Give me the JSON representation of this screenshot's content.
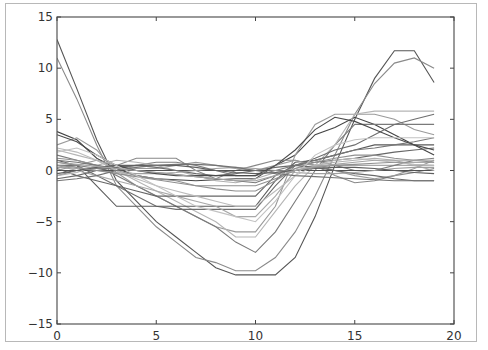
{
  "chart_data": {
    "type": "line",
    "title": "",
    "xlabel": "",
    "ylabel": "",
    "xlim": [
      0,
      20
    ],
    "ylim": [
      -15,
      15
    ],
    "grid": false,
    "legend": null,
    "xticks": [
      "0",
      "5",
      "10",
      "15",
      "20"
    ],
    "yticks": [
      "15",
      "10",
      "5",
      "0",
      "−5",
      "−10",
      "−15"
    ],
    "x": [
      0,
      1,
      2,
      3,
      4,
      5,
      6,
      7,
      8,
      9,
      10,
      11,
      12,
      13,
      14,
      15,
      16,
      17,
      18,
      19
    ],
    "series": [
      {
        "name": "s1",
        "color": "#555555",
        "values": [
          12.8,
          8.0,
          3.0,
          -1.0,
          -3.0,
          -5.0,
          -6.5,
          -8.0,
          -9.5,
          -10.2,
          -10.2,
          -10.2,
          -8.5,
          -4.5,
          0.5,
          5.0,
          9.0,
          11.7,
          11.7,
          8.6
        ]
      },
      {
        "name": "s2",
        "color": "#8a8a8a",
        "values": [
          11.0,
          7.0,
          2.5,
          -1.5,
          -3.5,
          -5.5,
          -7.0,
          -8.5,
          -9.0,
          -9.8,
          -9.8,
          -8.5,
          -6.0,
          -2.5,
          1.5,
          5.5,
          8.5,
          10.5,
          11.0,
          10.0
        ]
      },
      {
        "name": "s3",
        "color": "#444444",
        "values": [
          3.8,
          3.0,
          1.2,
          0.2,
          -0.5,
          -0.8,
          -0.9,
          -1.0,
          -0.9,
          -0.8,
          -0.8,
          0.5,
          1.5,
          3.5,
          4.2,
          5.2,
          4.5,
          3.5,
          2.5,
          1.5
        ]
      },
      {
        "name": "s4",
        "color": "#9a9a9a",
        "values": [
          2.5,
          3.2,
          2.0,
          -0.2,
          -1.5,
          -2.5,
          -3.5,
          -4.5,
          -5.5,
          -6.0,
          -6.0,
          -3.5,
          1.5,
          4.5,
          5.5,
          5.5,
          5.5,
          5.0,
          4.0,
          3.5
        ]
      },
      {
        "name": "s5",
        "color": "#7a7a7a",
        "values": [
          1.5,
          1.0,
          0.5,
          -0.5,
          -1.5,
          -2.5,
          -3.5,
          -4.5,
          -5.5,
          -7.0,
          -8.0,
          -6.0,
          -3.0,
          0.0,
          2.5,
          4.5,
          4.5,
          4.5,
          4.5,
          4.5
        ]
      },
      {
        "name": "s6",
        "color": "#b5b5b5",
        "values": [
          2.0,
          1.5,
          1.0,
          0.0,
          -1.0,
          -2.0,
          -3.0,
          -4.0,
          -5.0,
          -6.5,
          -6.5,
          -4.0,
          -1.5,
          0.5,
          2.5,
          5.5,
          5.8,
          5.8,
          5.8,
          5.8
        ]
      },
      {
        "name": "s7",
        "color": "#6e6e6e",
        "values": [
          0.5,
          0.5,
          -0.5,
          -1.5,
          -2.5,
          -3.5,
          -3.8,
          -3.8,
          -3.8,
          -3.8,
          -3.8,
          -1.5,
          0.5,
          1.2,
          2.0,
          2.5,
          3.5,
          4.5,
          5.0,
          5.5
        ]
      },
      {
        "name": "s8",
        "color": "#5a5a5a",
        "values": [
          1.0,
          0.5,
          -1.5,
          -3.5,
          -3.5,
          -3.5,
          -3.5,
          -3.5,
          -3.5,
          -3.5,
          -3.5,
          -1.0,
          0.8,
          1.0,
          1.5,
          2.0,
          2.5,
          2.5,
          2.5,
          2.5
        ]
      },
      {
        "name": "s9",
        "color": "#a8a8a8",
        "values": [
          0.5,
          0.0,
          -0.5,
          -1.0,
          -1.5,
          -2.0,
          -2.5,
          -3.0,
          -3.5,
          -4.5,
          -4.5,
          -2.5,
          0.0,
          0.5,
          0.5,
          0.5,
          0.5,
          0.5,
          0.5,
          0.5
        ]
      },
      {
        "name": "s10",
        "color": "#888888",
        "values": [
          -0.5,
          0.0,
          0.2,
          0.5,
          1.2,
          1.2,
          1.2,
          0.0,
          -0.8,
          0.0,
          0.5,
          1.0,
          1.0,
          0.5,
          -0.5,
          -1.2,
          -1.0,
          -0.5,
          -0.2,
          0.2
        ]
      },
      {
        "name": "s11",
        "color": "#666666",
        "values": [
          0.2,
          -0.5,
          -1.0,
          -1.5,
          -2.0,
          -2.5,
          -2.5,
          -2.5,
          -2.5,
          -2.5,
          -2.5,
          -0.5,
          0.5,
          0.8,
          1.0,
          1.2,
          1.5,
          1.8,
          2.0,
          2.2
        ]
      },
      {
        "name": "s12",
        "color": "#999999",
        "values": [
          0.0,
          0.5,
          1.0,
          0.5,
          0.2,
          0.2,
          0.5,
          0.8,
          0.5,
          0.2,
          0.0,
          0.5,
          1.0,
          0.5,
          0.0,
          -0.5,
          -0.8,
          -0.5,
          0.2,
          1.0
        ]
      },
      {
        "name": "s13",
        "color": "#7f7f7f",
        "values": [
          0.8,
          0.5,
          0.2,
          0.2,
          0.5,
          0.8,
          0.8,
          0.5,
          0.0,
          -0.5,
          -0.5,
          0.0,
          0.5,
          1.0,
          0.5,
          0.0,
          0.0,
          0.5,
          1.0,
          1.2
        ]
      },
      {
        "name": "s14",
        "color": "#505050",
        "values": [
          0.0,
          0.0,
          0.0,
          0.0,
          0.0,
          0.0,
          0.0,
          0.0,
          0.0,
          0.0,
          0.0,
          0.0,
          0.0,
          0.0,
          0.0,
          0.0,
          0.0,
          0.0,
          0.0,
          0.0
        ]
      },
      {
        "name": "s15",
        "color": "#b0b0b0",
        "values": [
          -0.5,
          -0.2,
          0.5,
          1.0,
          0.8,
          0.5,
          0.0,
          -0.5,
          -1.0,
          -1.2,
          -0.8,
          -0.2,
          0.2,
          0.5,
          0.8,
          1.0,
          1.2,
          1.0,
          0.5,
          0.0
        ]
      },
      {
        "name": "s16",
        "color": "#909090",
        "values": [
          1.2,
          1.0,
          0.5,
          0.0,
          -0.5,
          -0.8,
          -1.0,
          -1.5,
          -1.8,
          -2.0,
          -2.0,
          -1.0,
          0.2,
          0.8,
          1.2,
          1.5,
          1.5,
          1.2,
          1.0,
          0.8
        ]
      },
      {
        "name": "s17",
        "color": "#6a6a6a",
        "values": [
          -0.8,
          -0.5,
          0.0,
          0.3,
          0.5,
          0.3,
          0.0,
          -0.3,
          -0.5,
          -0.3,
          0.0,
          0.3,
          0.5,
          0.3,
          0.0,
          -0.3,
          -0.5,
          -0.8,
          -1.0,
          -1.0
        ]
      },
      {
        "name": "s18",
        "color": "#a0a0a0",
        "values": [
          0.3,
          0.2,
          0.0,
          -0.2,
          -0.3,
          -0.3,
          -0.2,
          0.0,
          0.2,
          0.3,
          0.2,
          0.0,
          -0.2,
          -0.3,
          -0.3,
          -0.2,
          0.0,
          0.2,
          0.3,
          0.3
        ]
      },
      {
        "name": "s19",
        "color": "#777777",
        "values": [
          1.0,
          0.8,
          0.5,
          0.2,
          0.0,
          -0.2,
          -0.4,
          -0.6,
          -0.8,
          -1.0,
          -1.2,
          -0.5,
          0.5,
          1.0,
          1.5,
          2.0,
          2.2,
          2.5,
          2.8,
          3.2
        ]
      },
      {
        "name": "s20",
        "color": "#bbbbbb",
        "values": [
          2.2,
          1.8,
          1.0,
          0.0,
          -0.8,
          -1.5,
          -2.0,
          -2.5,
          -3.0,
          -3.5,
          -3.5,
          -2.0,
          -0.5,
          0.5,
          1.0,
          1.2,
          1.0,
          0.8,
          0.6,
          0.5
        ]
      },
      {
        "name": "s21",
        "color": "#5f5f5f",
        "values": [
          -0.3,
          0.0,
          0.3,
          0.5,
          0.5,
          0.5,
          0.5,
          0.3,
          0.0,
          -0.2,
          -0.3,
          -0.2,
          0.0,
          0.2,
          0.3,
          0.3,
          0.2,
          0.0,
          -0.2,
          -0.3
        ]
      },
      {
        "name": "s22",
        "color": "#8f8f8f",
        "values": [
          0.5,
          0.3,
          0.0,
          -0.3,
          -0.6,
          -0.9,
          -1.2,
          -1.5,
          -1.5,
          -1.5,
          -1.5,
          -0.8,
          0.0,
          0.3,
          0.5,
          0.6,
          0.7,
          0.8,
          0.8,
          0.8
        ]
      },
      {
        "name": "s23",
        "color": "#4a4a4a",
        "values": [
          3.5,
          2.8,
          1.5,
          0.5,
          0.0,
          -0.3,
          -0.5,
          -0.5,
          -0.5,
          -0.5,
          -0.5,
          0.5,
          2.0,
          4.0,
          5.2,
          4.8,
          4.0,
          3.2,
          2.5,
          2.0
        ]
      },
      {
        "name": "s24",
        "color": "#c2c2c2",
        "values": [
          1.8,
          2.2,
          1.5,
          0.5,
          -0.5,
          -1.5,
          -2.5,
          -3.5,
          -4.0,
          -4.5,
          -5.0,
          -3.0,
          -0.5,
          1.5,
          2.5,
          3.0,
          3.2,
          3.2,
          3.2,
          3.2
        ]
      },
      {
        "name": "s25",
        "color": "#737373",
        "values": [
          -1.0,
          -0.8,
          -0.5,
          0.0,
          0.3,
          0.5,
          0.6,
          0.6,
          0.5,
          0.3,
          0.0,
          -0.3,
          -0.5,
          -0.6,
          -0.7,
          -0.8,
          -0.9,
          -1.0,
          -1.0,
          -1.0
        ]
      },
      {
        "name": "s26",
        "color": "#a4a4a4",
        "values": [
          0.8,
          0.6,
          0.4,
          0.2,
          0.0,
          -0.2,
          -0.4,
          -0.6,
          -0.8,
          -1.0,
          -1.0,
          -0.5,
          0.0,
          0.4,
          0.6,
          0.8,
          1.0,
          1.0,
          1.0,
          1.0
        ]
      }
    ]
  },
  "axes": {
    "plot_left": 57,
    "plot_top": 17,
    "plot_right": 454,
    "plot_bottom": 324,
    "axis_color": "#555555",
    "tick_color": "#444444"
  }
}
